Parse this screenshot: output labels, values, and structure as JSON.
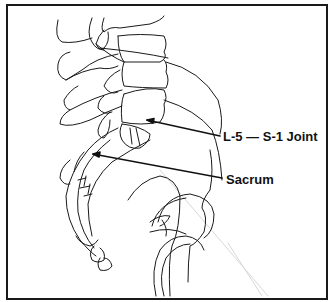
{
  "diagram": {
    "labels": [
      {
        "id": "joint",
        "text": "L-5 — S-1 Joint"
      },
      {
        "id": "sacrum",
        "text": "Sacrum"
      }
    ],
    "colors": {
      "line": "#1a1a1a",
      "frame": "#1a1a1a",
      "background": "#ffffff",
      "faint_line": "#d8d8d8"
    }
  }
}
